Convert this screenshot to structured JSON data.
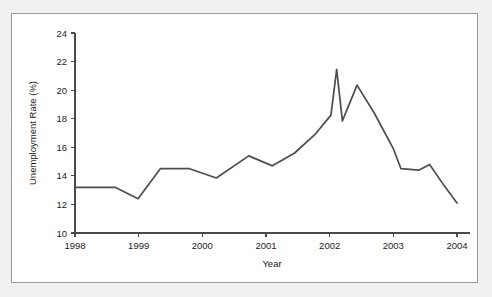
{
  "figure": {
    "background_color": "#f1f1f1",
    "panel_color": "#ffffff",
    "border_color": "#9a9a9a",
    "line_color": "#4d4d4d"
  },
  "chart_data": {
    "type": "line",
    "title": "",
    "subtitle": "",
    "xlabel": "Year",
    "ylabel": "Unemployment Rate (%)",
    "xlim": [
      1998,
      2004
    ],
    "ylim": [
      10,
      24
    ],
    "grid": false,
    "legend": false,
    "legend_position": "none",
    "xticks": [
      1998,
      1999,
      2000,
      2001,
      2002,
      2003,
      2004
    ],
    "xtick_labels": [
      "1998",
      "1999",
      "2000",
      "2001",
      "2002",
      "2003",
      "2004"
    ],
    "yticks": [
      10,
      12,
      14,
      16,
      18,
      20,
      22,
      24
    ],
    "ytick_labels": [
      "10",
      "12",
      "14",
      "16",
      "18",
      "20",
      "22",
      "24"
    ],
    "series": [
      {
        "name": "Unemployment Rate",
        "color": "#4d4d4d",
        "x": [
          1998.0,
          1998.63,
          1998.99,
          1999.34,
          1999.8,
          2000.22,
          2000.73,
          2001.1,
          2001.45,
          2001.77,
          2002.02,
          2002.11,
          2002.2,
          2002.43,
          2002.7,
          2003.0,
          2003.12,
          2003.4,
          2003.57,
          2003.8,
          2004.0
        ],
        "y": [
          13.2,
          13.2,
          12.4,
          14.5,
          14.5,
          13.85,
          15.4,
          14.7,
          15.6,
          16.9,
          18.25,
          21.45,
          17.85,
          20.35,
          18.4,
          15.9,
          14.5,
          14.4,
          14.8,
          13.3,
          12.1
        ]
      }
    ]
  }
}
